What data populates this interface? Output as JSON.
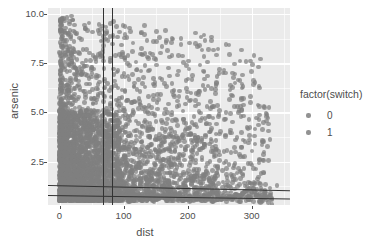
{
  "chart_data": {
    "type": "scatter",
    "title": "",
    "xlabel": "dist",
    "ylabel": "arsenic",
    "xlim": [
      -18,
      360
    ],
    "ylim": [
      0.3,
      10.3
    ],
    "xticks": [
      "0",
      "100",
      "200",
      "300"
    ],
    "xtick_values": [
      0,
      100,
      200,
      300
    ],
    "yticks": [
      "2.5",
      "5.0",
      "7.5",
      "10.0"
    ],
    "ytick_values": [
      2.5,
      5.0,
      7.5,
      10.0
    ],
    "grid": true,
    "panel_background": "#ebebeb",
    "gridline_color": "#ffffff",
    "point_color": "#7f7f7f",
    "legend": {
      "title": "factor(switch)",
      "position": "right",
      "entries": [
        {
          "label": "0",
          "color": "#7f7f7f"
        },
        {
          "label": "1",
          "color": "#7f7f7f"
        }
      ]
    },
    "annotations": {
      "vertical_lines": [
        {
          "x": 68,
          "color": "#333333"
        },
        {
          "x": 82,
          "color": "#333333"
        }
      ],
      "horizontal_lines": [
        {
          "y_left": 1.32,
          "y_right": 1.05,
          "color": "#333333"
        },
        {
          "y_left": 0.8,
          "y_right": 0.62,
          "color": "#333333"
        }
      ]
    },
    "series": [
      {
        "name": "0",
        "x": [
          2,
          3,
          4,
          5,
          6,
          7,
          8,
          9,
          10,
          11,
          12,
          13,
          14,
          15,
          16,
          17,
          18,
          19,
          20,
          21,
          22,
          23,
          24,
          25,
          26,
          27,
          28,
          29,
          30,
          31,
          32,
          33,
          34,
          35,
          36,
          37,
          38,
          39,
          40,
          41,
          42,
          43,
          44,
          45,
          46,
          47,
          48,
          49,
          50,
          52,
          54,
          56,
          58,
          60,
          62,
          64,
          66,
          68,
          70,
          72,
          74,
          76,
          78,
          80,
          82,
          84,
          86,
          88,
          90,
          92,
          94,
          96,
          98,
          100,
          104,
          108,
          112,
          116,
          120,
          124,
          128,
          132,
          136,
          140,
          145,
          150,
          155,
          160,
          165,
          170,
          180,
          190,
          200,
          210,
          225,
          240,
          260,
          290,
          320,
          340
        ],
        "y": [
          1.2,
          2.4,
          0.9,
          3.1,
          1.8,
          2.2,
          4.0,
          1.5,
          2.7,
          3.4,
          1.1,
          5.2,
          2.0,
          1.7,
          3.8,
          2.5,
          6.1,
          1.4,
          2.9,
          4.4,
          1.9,
          3.2,
          2.1,
          5.6,
          1.6,
          2.8,
          3.6,
          1.3,
          4.8,
          2.3,
          7.3,
          1.8,
          3.0,
          2.6,
          1.5,
          4.2,
          2.2,
          3.5,
          1.9,
          5.9,
          2.7,
          1.4,
          3.3,
          2.0,
          4.6,
          1.7,
          2.4,
          3.9,
          1.2,
          2.8,
          5.1,
          1.6,
          3.4,
          2.1,
          4.3,
          1.9,
          2.6,
          7.8,
          3.1,
          1.5,
          2.3,
          4.9,
          1.8,
          3.7,
          2.2,
          9.6,
          1.4,
          2.9,
          5.4,
          1.7,
          3.2,
          2.5,
          4.1,
          1.3,
          2.7,
          3.8,
          1.9,
          5.0,
          2.4,
          1.6,
          3.5,
          2.0,
          4.5,
          1.2,
          2.8,
          3.1,
          1.7,
          2.3,
          4.0,
          1.5,
          2.6,
          3.3,
          1.1,
          2.1,
          1.8,
          1.4,
          2.5,
          1.0,
          0.9,
          1.3
        ]
      },
      {
        "name": "1",
        "x": [
          1,
          2,
          3,
          4,
          5,
          6,
          7,
          8,
          9,
          10,
          11,
          12,
          13,
          14,
          15,
          16,
          17,
          18,
          19,
          20,
          21,
          22,
          23,
          24,
          25,
          26,
          27,
          28,
          29,
          30,
          31,
          32,
          33,
          34,
          35,
          36,
          37,
          38,
          39,
          40,
          41,
          42,
          43,
          44,
          45,
          46,
          47,
          48,
          50,
          52,
          54,
          56,
          58,
          60,
          62,
          64,
          66,
          68,
          70,
          72,
          74,
          76,
          78,
          80,
          84,
          88,
          92,
          96,
          100,
          105,
          110,
          115,
          120,
          125,
          130,
          135,
          140,
          150,
          160,
          170,
          185,
          200,
          215,
          235,
          255,
          275,
          300,
          330
        ],
        "y": [
          2.0,
          1.5,
          3.2,
          2.6,
          4.1,
          1.8,
          2.9,
          5.3,
          1.3,
          3.5,
          2.2,
          6.4,
          1.7,
          2.4,
          3.9,
          1.1,
          4.7,
          2.7,
          1.9,
          3.1,
          2.3,
          5.8,
          1.4,
          2.8,
          3.6,
          1.6,
          4.3,
          2.1,
          7.0,
          1.8,
          2.5,
          3.3,
          1.2,
          4.9,
          2.0,
          3.7,
          1.5,
          2.6,
          5.5,
          1.9,
          3.0,
          2.2,
          4.4,
          1.3,
          2.9,
          3.8,
          1.7,
          2.4,
          6.8,
          1.5,
          3.4,
          2.1,
          4.6,
          1.8,
          2.7,
          3.2,
          1.4,
          8.2,
          2.3,
          5.0,
          1.6,
          2.8,
          3.5,
          2.0,
          4.2,
          1.3,
          2.6,
          3.1,
          1.8,
          2.4,
          4.8,
          1.5,
          3.0,
          2.2,
          5.2,
          1.7,
          2.9,
          3.6,
          2.1,
          1.4,
          2.7,
          3.3,
          1.9,
          2.5,
          1.2,
          1.6,
          1.0,
          0.8
        ]
      }
    ]
  }
}
